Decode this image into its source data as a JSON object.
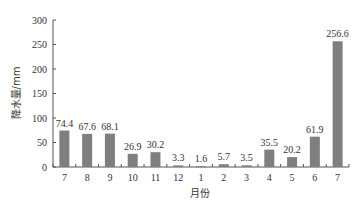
{
  "chart_data": {
    "type": "bar",
    "title": "",
    "xlabel": "月份",
    "ylabel": "降水量/mm",
    "categories": [
      "7",
      "8",
      "9",
      "10",
      "11",
      "12",
      "1",
      "2",
      "3",
      "4",
      "5",
      "6",
      "7"
    ],
    "values": [
      74.4,
      67.6,
      68.1,
      26.9,
      30.2,
      3.3,
      1.6,
      5.7,
      3.5,
      35.5,
      20.2,
      61.9,
      256.6
    ],
    "value_labels": [
      "74.4",
      "67.6",
      "68.1",
      "26.9",
      "30.2",
      "3.3",
      "1.6",
      "5.7",
      "3.5",
      "35.5",
      "20.2",
      "61.9",
      "256.6"
    ],
    "ylim": [
      0,
      300
    ],
    "yticks": [
      0,
      50,
      100,
      150,
      200,
      250,
      300
    ],
    "grid": false,
    "legend": null,
    "bar_color": "#7f7f7f"
  }
}
